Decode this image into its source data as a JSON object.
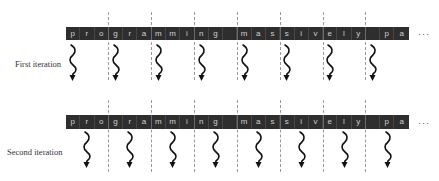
{
  "diagram": {
    "cell_width": 14.29,
    "bar_left": 66,
    "chars_per_segment": 3,
    "ellipsis": "···",
    "colors": {
      "bar": "#2e2e2e",
      "cell_text": "#cfcfcf",
      "divider": "#9a9a9a",
      "arrow": "#111111",
      "label": "#333333"
    },
    "characters": [
      "p",
      "r",
      "o",
      "g",
      "r",
      "a",
      "m",
      "m",
      "i",
      "n",
      "g",
      " ",
      "m",
      "a",
      "s",
      "s",
      "i",
      "v",
      "e",
      "l",
      "y",
      " ",
      "p",
      "a"
    ],
    "rows": [
      {
        "label": "First iteration",
        "label_left": 15,
        "label_top": 59,
        "bar_top": 27,
        "bar_height": 13,
        "divider_top": 12,
        "divider_bottom": 80,
        "arrow_top": 44,
        "arrow_char_offset": 0,
        "ellipsis_top": 29
      },
      {
        "label": "Second iteration",
        "label_left": 7,
        "label_top": 147,
        "bar_top": 115,
        "bar_height": 14,
        "divider_top": 100,
        "divider_bottom": 172,
        "arrow_top": 131,
        "arrow_char_offset": 1,
        "ellipsis_top": 118
      }
    ]
  }
}
